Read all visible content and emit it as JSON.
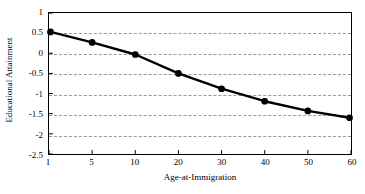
{
  "chart_data": {
    "type": "line",
    "title": "",
    "xlabel": "Age-at-Immigration",
    "ylabel": "Educational Attainment",
    "categories": [
      "1",
      "5",
      "10",
      "20",
      "30",
      "40",
      "50",
      "60"
    ],
    "values": [
      0.53,
      0.27,
      -0.03,
      -0.5,
      -0.88,
      -1.19,
      -1.43,
      -1.6
    ],
    "series": [
      {
        "name": "Educational Attainment",
        "values": [
          0.53,
          0.27,
          -0.03,
          -0.5,
          -0.88,
          -1.19,
          -1.43,
          -1.6
        ]
      }
    ],
    "ylim": [
      -2.5,
      1
    ],
    "yticks": [
      1,
      0.5,
      0,
      -0.5,
      -1,
      -1.5,
      -2,
      -2.5
    ],
    "ytick_labels": [
      "1",
      "0.5",
      "0",
      "-0.5",
      "-1",
      "-1.5",
      "-2",
      "-2.5"
    ],
    "xtick_labels": [
      "1",
      "5",
      "10",
      "20",
      "30",
      "40",
      "50",
      "60"
    ],
    "grid": true,
    "grid_axis": "y",
    "grid_style": "dashed",
    "legend": false,
    "legend_position": "none",
    "x_scale": "categorical",
    "line_color": "#000000",
    "marker_color": "#000000",
    "marker": "circle",
    "background_color": "#ffffff",
    "axis_color": "#000000",
    "grid_color": "#9a9a9a"
  }
}
